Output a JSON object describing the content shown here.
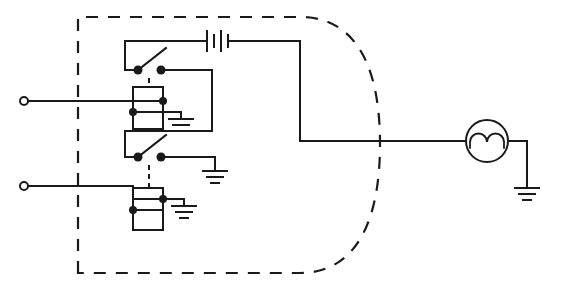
{
  "diagram": {
    "type": "electrical-schematic",
    "canvas": {
      "width": 567,
      "height": 285
    },
    "line_color": "#1a1a1a",
    "background_color": "#ffffff"
  },
  "boundary": {
    "name": "dashed-enclosure",
    "style": "dashed",
    "shape": "d-shape-rounded-right",
    "dash_pattern": "12 10",
    "left_x": 78,
    "top_y": 17,
    "bottom_y": 273,
    "arc_right_x": 372
  },
  "components": {
    "battery": {
      "name": "battery",
      "label": "",
      "cells": 2,
      "plates": 4,
      "center_x": 222,
      "center_y": 41
    },
    "horn": {
      "name": "horn",
      "label": "",
      "center_x": 487,
      "center_y": 141,
      "radius": 21,
      "humps": 2
    },
    "relay_upper": {
      "name": "relay-upper",
      "coil_x": 133,
      "coil_y": 87,
      "coil_width": 30,
      "coil_height": 42,
      "switch_y": 70,
      "contact_left_x": 138,
      "contact_right_x": 161,
      "state": "open"
    },
    "relay_lower": {
      "name": "relay-lower",
      "coil_x": 133,
      "coil_y": 188,
      "coil_width": 30,
      "coil_height": 42,
      "switch_y": 157,
      "contact_left_x": 138,
      "contact_right_x": 161,
      "state": "open"
    },
    "terminal_upper": {
      "name": "input-terminal-upper",
      "x": 24,
      "y": 101,
      "radius": 4
    },
    "terminal_lower": {
      "name": "input-terminal-lower",
      "x": 24,
      "y": 186,
      "radius": 4
    },
    "grounds": [
      {
        "name": "ground-upper-coil",
        "x": 181,
        "y": 119
      },
      {
        "name": "ground-lower-switch",
        "x": 215,
        "y": 171
      },
      {
        "name": "ground-lower-coil",
        "x": 184,
        "y": 206
      },
      {
        "name": "ground-horn",
        "x": 527,
        "y": 188
      }
    ]
  },
  "nets": {
    "battery_to_switch": "Battery positive feeds upper switch common via top rail",
    "switch_to_horn": "Upper switch output routes right then down to horn",
    "coil_to_ground": "Each relay coil returns to chassis ground",
    "horn_to_ground": "Horn returns to chassis ground"
  }
}
